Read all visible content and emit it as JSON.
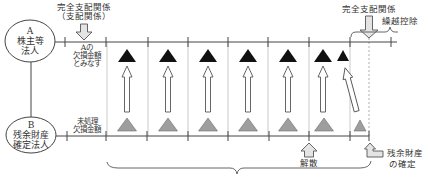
{
  "entity_a": {
    "letter": "A",
    "line1": "株主等",
    "line2": "法人"
  },
  "entity_b": {
    "letter": "B",
    "line1": "残余財産",
    "line2": "確定法人"
  },
  "top_left_label": {
    "line1": "完全支配関係",
    "line2": "（支配関係）"
  },
  "top_right_label": {
    "line1": "完全支配関係"
  },
  "carryforward_label": "繰越控除",
  "a_loss_label": {
    "line1": "Aの",
    "line2": "欠損金額",
    "line3": "とみなす"
  },
  "b_loss_label": {
    "line1": "未処理",
    "line2": "欠損金額"
  },
  "dissolution_label": "解散",
  "residual_label": {
    "line1": "残余財産",
    "line2": "の確定"
  },
  "colors": {
    "a_loss_triangle": "#111111",
    "b_loss_triangle": "#9e9e9e",
    "line": "#444444",
    "background": "#ffffff"
  }
}
